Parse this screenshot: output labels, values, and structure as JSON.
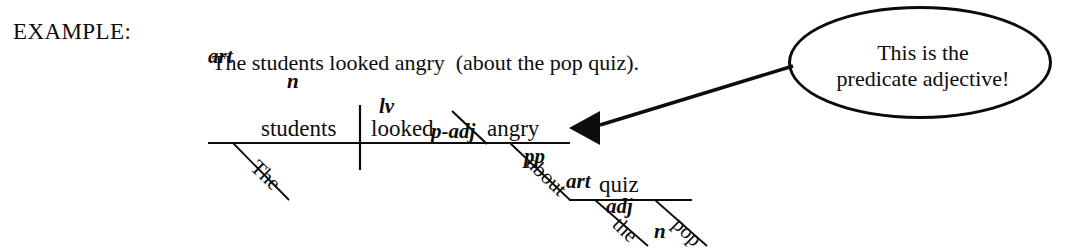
{
  "page": {
    "background_color": "#ffffff",
    "ink_color": "#0d0d0d"
  },
  "header": {
    "example_label": "EXAMPLE:"
  },
  "pos_tags": {
    "label": "part of speech tags",
    "tokens": [
      {
        "text": "art",
        "x": 208
      },
      {
        "text": "n",
        "x": 287
      },
      {
        "text": "lv",
        "x": 379
      },
      {
        "text": "p-adj",
        "x": 431
      },
      {
        "text": "pp",
        "x": 524
      },
      {
        "text": "art",
        "x": 566
      },
      {
        "text": "adj",
        "x": 606
      },
      {
        "text": "n",
        "x": 654
      }
    ]
  },
  "sentence": {
    "text": "The students looked angry  (about the pop quiz)."
  },
  "callout": {
    "line1": "This is the",
    "line2": "predicate adjective!"
  },
  "diagram": {
    "type": "reed-kellogg-sentence-diagram",
    "baseline_words": [
      {
        "role": "subject",
        "text": "students",
        "x": 262,
        "y": 137
      },
      {
        "role": "linking-verb",
        "text": "looked",
        "x": 372,
        "y": 137
      },
      {
        "role": "predicate-adjective",
        "text": "angry",
        "x": 488,
        "y": 137
      }
    ],
    "modifier_words": [
      {
        "role": "article-modifier",
        "text": "The",
        "x": 243,
        "y": 150,
        "rotation": 44
      },
      {
        "role": "preposition",
        "text": "about",
        "x": 520,
        "y": 146,
        "rotation": 44
      },
      {
        "role": "article-modifier",
        "text": "the",
        "x": 606,
        "y": 206,
        "rotation": 44
      },
      {
        "role": "adjective-modifier",
        "text": "pop",
        "x": 665,
        "y": 206,
        "rotation": 44
      }
    ],
    "object_of_preposition": {
      "text": "quiz",
      "x": 600,
      "y": 193
    },
    "annotation_arrow": {
      "points_to": "angry",
      "from_x": 793,
      "from_y": 66,
      "to_x": 600,
      "to_y": 124
    }
  }
}
